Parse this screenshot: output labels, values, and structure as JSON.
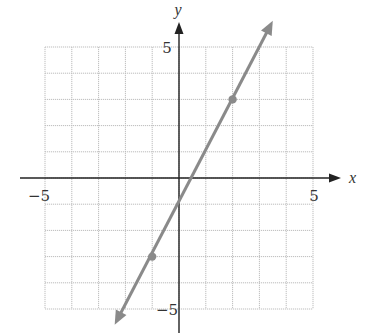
{
  "chart_data": {
    "type": "line",
    "title": "",
    "xlabel": "x",
    "ylabel": "y",
    "xlim": [
      -5,
      5
    ],
    "ylim": [
      -5,
      5
    ],
    "grid": true,
    "grid_step": 1,
    "tick_labels": {
      "x": [
        {
          "value": -5,
          "label": "−5"
        },
        {
          "value": 5,
          "label": "5"
        }
      ],
      "y": [
        {
          "value": 5,
          "label": "5"
        },
        {
          "value": -5,
          "label": "−5"
        }
      ]
    },
    "series": [
      {
        "name": "y = 2x - 1",
        "equation": "y = 2x - 1",
        "slope": 2,
        "intercept": -1,
        "marked_points": [
          {
            "x": 2,
            "y": 3
          },
          {
            "x": -1,
            "y": -3
          }
        ],
        "arrows_both_ends": true,
        "endpoints": [
          {
            "x": -2.4,
            "y": -5.6
          },
          {
            "x": 3.5,
            "y": 6.0
          }
        ]
      }
    ],
    "legend": null
  },
  "colors": {
    "axis": "#222222",
    "grid": "#bdbdbd",
    "line": "#8a8a8a",
    "point": "#8a8a8a",
    "text": "#333333"
  }
}
